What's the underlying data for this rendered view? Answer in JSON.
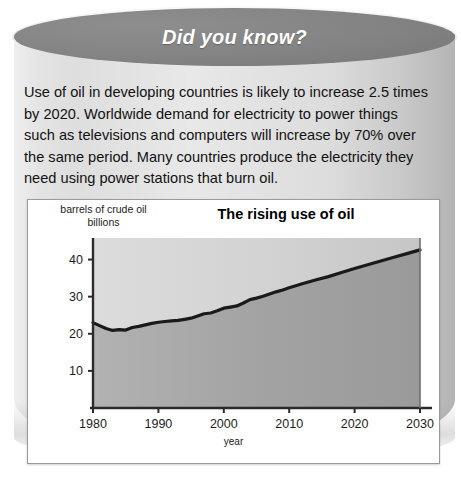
{
  "card": {
    "header_title": "Did you know?",
    "body_text": "Use of oil in developing countries is likely to increase 2.5 times by 2020. Worldwide demand for electricity to power things such as televisions and computers will increase by 70% over the same period. Many countries produce the electricity they need using power stations that burn oil."
  },
  "chart_data": {
    "type": "area",
    "title": "The rising use of oil",
    "xlabel": "year",
    "ylabel_line1": "barrels of crude oil",
    "ylabel_line2": "billions",
    "xlim": [
      1980,
      2030
    ],
    "ylim": [
      0,
      45
    ],
    "xticks": [
      "1980",
      "1990",
      "2000",
      "2010",
      "2020",
      "2030"
    ],
    "xtick_values": [
      1980,
      1990,
      2000,
      2010,
      2020,
      2030
    ],
    "yticks": [
      "10",
      "20",
      "30",
      "40"
    ],
    "ytick_values": [
      10,
      20,
      30,
      40
    ],
    "grid": false,
    "legend": "none",
    "line_color": "#1a1a1a",
    "fill_color_below": "#a8a8a8",
    "fill_color_above": "#d6d6d6",
    "series": [
      {
        "name": "Oil use",
        "x": [
          1980,
          1981,
          1982,
          1983,
          1984,
          1985,
          1986,
          1987,
          1988,
          1989,
          1990,
          1991,
          1992,
          1993,
          1994,
          1995,
          1996,
          1997,
          1998,
          1999,
          2000,
          2001,
          2002,
          2003,
          2004,
          2005,
          2006,
          2007,
          2008,
          2009,
          2010,
          2012,
          2014,
          2016,
          2018,
          2020,
          2022,
          2024,
          2026,
          2028,
          2030
        ],
        "values": [
          23.0,
          22.2,
          21.4,
          20.9,
          21.1,
          21.0,
          21.7,
          22.0,
          22.4,
          22.8,
          23.1,
          23.3,
          23.5,
          23.6,
          23.9,
          24.2,
          24.8,
          25.4,
          25.6,
          26.2,
          26.9,
          27.2,
          27.5,
          28.3,
          29.2,
          29.6,
          30.1,
          30.7,
          31.3,
          31.8,
          32.4,
          33.5,
          34.5,
          35.4,
          36.5,
          37.6,
          38.6,
          39.6,
          40.6,
          41.6,
          42.6
        ]
      }
    ]
  }
}
